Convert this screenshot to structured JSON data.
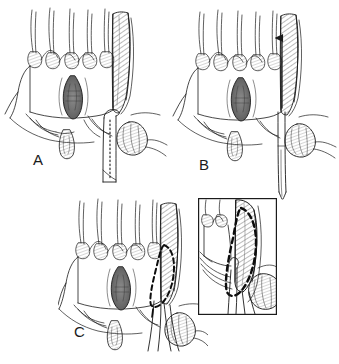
{
  "figure": {
    "style": "pen-and-ink line drawing, black on white",
    "background_color": "#ffffff",
    "ink_color": "#1b1b1b",
    "panel_labels": [
      "A",
      "B",
      "C"
    ],
    "panel_label_positions": [
      {
        "label": "A",
        "x": 33,
        "y": 158
      },
      {
        "label": "B",
        "x": 199,
        "y": 163
      },
      {
        "label": "C",
        "x": 74,
        "y": 330
      }
    ],
    "caption_partial": "",
    "inset": {
      "present": true,
      "border_color": "#1b1b1b",
      "box": {
        "x": 198,
        "y": 198,
        "width": 79,
        "height": 117
      },
      "description": "magnified detail of dashed resection outline over hatched band"
    },
    "annotations": [
      {
        "type": "dotted-line",
        "panel": "A",
        "meaning": "planned incision line along instrument"
      },
      {
        "type": "arrow",
        "panel": "B",
        "direction": "up",
        "meaning": "instrument advanced superiorly"
      },
      {
        "type": "dashed-outline",
        "panel": "C",
        "meaning": "elliptical resection margin"
      },
      {
        "type": "dashed-outline",
        "panel": "inset",
        "meaning": "elliptical resection margin magnified"
      }
    ],
    "anatomy": [
      {
        "name": "villous-projections",
        "location": "superior border",
        "count": 6
      },
      {
        "name": "central-lesion",
        "shape": "dark elongated ellipse",
        "panels": [
          "A",
          "B",
          "C"
        ]
      },
      {
        "name": "hatched-band",
        "orientation": "vertical",
        "shading": "diagonal hatching"
      },
      {
        "name": "rounded-nodule",
        "location": "lower right",
        "panels": [
          "A",
          "B",
          "C",
          "inset"
        ]
      },
      {
        "name": "pendant-lobule",
        "location": "inferior midline"
      },
      {
        "name": "instrument-shaft",
        "panels": [
          "A",
          "B",
          "C",
          "inset"
        ]
      }
    ]
  }
}
